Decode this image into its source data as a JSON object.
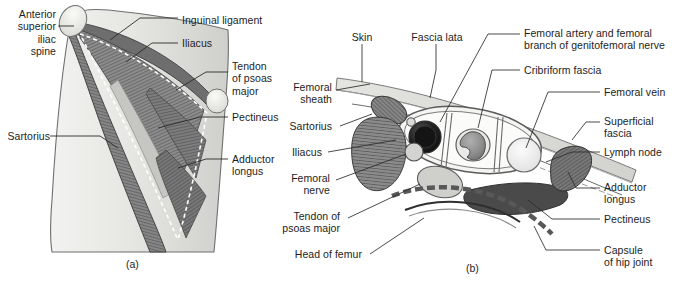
{
  "figure": {
    "type": "anatomical-illustration",
    "title_a": "(a)",
    "title_b": "(b)",
    "background": "#ffffff",
    "ink": "#1d1d1d"
  },
  "panel_a": {
    "caption": "(a)",
    "description": "Anterior view of the femoral triangle region of the thigh showing inguinal ligament, sartorius, iliacus, psoas tendon, pectineus and adductor longus",
    "labels": [
      {
        "id": "anterior-superior-iliac-spine",
        "text": "Anterior\nsuperior\niliac\nspine",
        "align": "right",
        "x": 8,
        "y": 8
      },
      {
        "id": "inguinal-ligament",
        "text": "Inguinal ligament",
        "align": "left",
        "x": 182,
        "y": 15
      },
      {
        "id": "iliacus",
        "text": "Iliacus",
        "align": "left",
        "x": 182,
        "y": 40
      },
      {
        "id": "tendon-of-psoas-major",
        "text": "Tendon\nof psoas\nmajor",
        "align": "left",
        "x": 232,
        "y": 64
      },
      {
        "id": "pectineus",
        "text": "Pectineus",
        "align": "left",
        "x": 232,
        "y": 113
      },
      {
        "id": "sartorius",
        "text": "Sartorius",
        "align": "right",
        "x": 8,
        "y": 132
      },
      {
        "id": "adductor-longus",
        "text": "Adductor\nlongus",
        "align": "left",
        "x": 232,
        "y": 155
      }
    ]
  },
  "panel_b": {
    "caption": "(b)",
    "description": "Transverse section through the femoral sheath showing skin, fascia lata, femoral artery, vein, lymph node and surrounding muscles",
    "labels_left": [
      {
        "id": "femoral-sheath",
        "text": "Femoral\nsheath",
        "x": 290,
        "y": 84
      },
      {
        "id": "sartorius",
        "text": "Sartorius",
        "x": 290,
        "y": 122
      },
      {
        "id": "iliacus",
        "text": "Iliacus",
        "x": 290,
        "y": 148
      },
      {
        "id": "femoral-nerve",
        "text": "Femoral\nnerve",
        "x": 290,
        "y": 174
      },
      {
        "id": "tendon-of-psoas-major",
        "text": "Tendon of\npsoas major",
        "x": 290,
        "y": 212
      },
      {
        "id": "head-of-femur",
        "text": "Head of femur",
        "x": 290,
        "y": 250
      }
    ],
    "labels_top": [
      {
        "id": "skin",
        "text": "Skin",
        "x": 352,
        "y": 33
      },
      {
        "id": "fascia-lata",
        "text": "Fascia lata",
        "x": 412,
        "y": 33
      }
    ],
    "labels_right": [
      {
        "id": "femoral-artery-and-genitofemoral-nerve",
        "text": "Femoral artery and femoral\nbranch of genitofemoral nerve",
        "x": 524,
        "y": 28
      },
      {
        "id": "cribriform-fascia",
        "text": "Cribriform fascia",
        "x": 524,
        "y": 66
      },
      {
        "id": "femoral-vein",
        "text": "Femoral vein",
        "x": 604,
        "y": 88
      },
      {
        "id": "superficial-fascia",
        "text": "Superficial\nfascia",
        "x": 604,
        "y": 117
      },
      {
        "id": "lymph-node",
        "text": "Lymph node",
        "x": 604,
        "y": 148
      },
      {
        "id": "adductor-longus",
        "text": "Adductor\nlongus",
        "x": 604,
        "y": 182
      },
      {
        "id": "pectineus",
        "text": "Pectineus",
        "x": 604,
        "y": 215
      },
      {
        "id": "capsule-of-hip-joint",
        "text": "Capsule\nof hip joint",
        "x": 604,
        "y": 246
      }
    ]
  },
  "colors": {
    "muscle_dark": "#6b6b6b",
    "muscle_mid": "#8e8e8e",
    "muscle_light": "#c9c9c9",
    "skin_band": "#dcdcd8",
    "artery": "#2a2a2a",
    "vein": "#8a8a8a",
    "lymph": "#ededed",
    "bone": "#e8e8e6",
    "outline": "#3a3a3a"
  }
}
